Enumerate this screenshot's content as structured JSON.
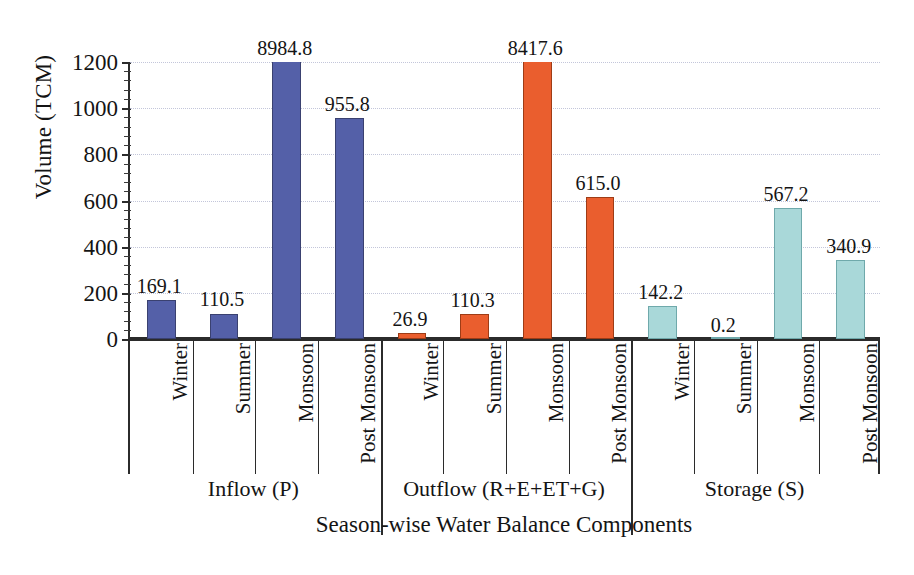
{
  "chart_data": {
    "type": "bar",
    "title": "",
    "xlabel": "Season-wise Water Balance Components",
    "ylabel": "Volume (TCM)",
    "ylim": [
      0,
      1200
    ],
    "ytick_step": 200,
    "yticks": [
      "0",
      "200",
      "400",
      "600",
      "800",
      "1000",
      "1200"
    ],
    "grid": true,
    "legend": "none",
    "note_clipped": "Bars exceeding the 1200 axis maximum are drawn clipped at the top of the plot; their true value is printed above the bar.",
    "groups": [
      {
        "name": "Inflow (P)",
        "color": "#5460a8",
        "color_name": "blue",
        "categories": [
          "Winter",
          "Summer",
          "Monsoon",
          "Post Monsoon"
        ],
        "values": [
          169.1,
          110.5,
          8984.8,
          955.8
        ],
        "labels": [
          "169.1",
          "110.5",
          "8984.8",
          "955.8"
        ]
      },
      {
        "name": "Outflow (R+E+ET+G)",
        "color": "#ea5e2e",
        "color_name": "orange",
        "categories": [
          "Winter",
          "Summer",
          "Monsoon",
          "Post Monsoon"
        ],
        "values": [
          26.9,
          110.3,
          8417.6,
          615.0
        ],
        "labels": [
          "26.9",
          "110.3",
          "8417.6",
          "615.0"
        ]
      },
      {
        "name": "Storage (S)",
        "color": "#a9d8d9",
        "color_name": "teal",
        "categories": [
          "Winter",
          "Summer",
          "Monsoon",
          "Post Monsoon"
        ],
        "values": [
          142.2,
          0.2,
          567.2,
          340.9
        ],
        "labels": [
          "142.2",
          "0.2",
          "567.2",
          "340.9"
        ]
      }
    ],
    "categories_flat": [
      "Winter",
      "Summer",
      "Monsoon",
      "Post Monsoon",
      "Winter",
      "Summer",
      "Monsoon",
      "Post Monsoon",
      "Winter",
      "Summer",
      "Monsoon",
      "Post Monsoon"
    ],
    "values_flat": [
      169.1,
      110.5,
      8984.8,
      955.8,
      26.9,
      110.3,
      8417.6,
      615.0,
      142.2,
      0.2,
      567.2,
      340.9
    ]
  },
  "colors": {
    "inflow": "#5460a8",
    "outflow": "#ea5e2e",
    "storage": "#a9d8d9",
    "axis": "#2b2b2b",
    "grid": "#b9bdd4",
    "background": "#ffffff"
  }
}
